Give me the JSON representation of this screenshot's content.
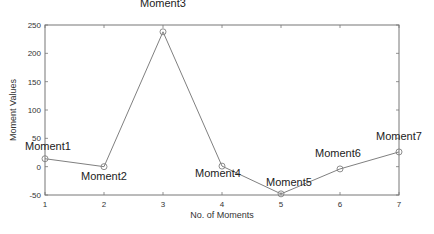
{
  "chart_data": {
    "type": "line",
    "title": "",
    "xlabel": "No. of Moments",
    "ylabel": "Moment Values",
    "x": [
      1,
      2,
      3,
      4,
      5,
      6,
      7
    ],
    "xlim": [
      1,
      7
    ],
    "ylim": [
      -50,
      250
    ],
    "xticks": [
      1,
      2,
      3,
      4,
      5,
      6,
      7
    ],
    "yticks": [
      -50,
      0,
      50,
      100,
      150,
      200,
      250
    ],
    "grid": false,
    "legend": null,
    "series": [
      {
        "name": "Moments",
        "values": [
          14,
          0,
          238,
          1,
          -48,
          -4,
          26
        ],
        "color": "#808080",
        "marker": "circle"
      }
    ],
    "annotations": [
      {
        "text": "Moment1",
        "x": 1,
        "y": 14
      },
      {
        "text": "Moment2",
        "x": 2,
        "y": 0
      },
      {
        "text": "Moment3",
        "x": 3,
        "y": 238
      },
      {
        "text": "Moment4",
        "x": 4,
        "y": 1
      },
      {
        "text": "Moment5",
        "x": 5,
        "y": -48
      },
      {
        "text": "Moment6",
        "x": 6,
        "y": -4
      },
      {
        "text": "Moment7",
        "x": 7,
        "y": 26
      }
    ]
  }
}
